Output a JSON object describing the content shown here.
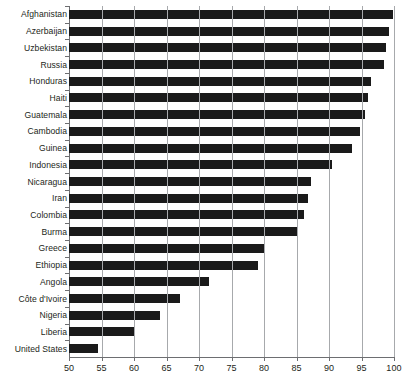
{
  "chart_data": {
    "type": "bar",
    "orientation": "horizontal",
    "title": "",
    "subtitle": "",
    "xlabel": "",
    "ylabel": "",
    "xlim": [
      50,
      100
    ],
    "ylim": null,
    "grid": true,
    "legend": null,
    "legend_position": "none",
    "bar_color": "#1a1a1a",
    "xticks": [
      50,
      55,
      60,
      65,
      70,
      75,
      80,
      85,
      90,
      95,
      100
    ],
    "xticklabels": [
      "50",
      "55",
      "60",
      "65",
      "70",
      "75",
      "80",
      "85",
      "90",
      "95",
      "100"
    ],
    "categories": [
      "Afghanistan",
      "Azerbaijan",
      "Uzbekistan",
      "Russia",
      "Honduras",
      "Haiti",
      "Guatemala",
      "Cambodia",
      "Guinea",
      "Indonesia",
      "Nicaragua",
      "Iran",
      "Colombia",
      "Burma",
      "Greece",
      "Ethiopia",
      "Angola",
      "Côte d'Ivoire",
      "Nigeria",
      "Liberia",
      "United States"
    ],
    "values": [
      99.9,
      99.2,
      98.8,
      98.4,
      96.4,
      96.0,
      95.6,
      94.8,
      93.6,
      90.5,
      87.2,
      86.8,
      86.2,
      85.2,
      80.0,
      79.0,
      71.5,
      67.0,
      64.0,
      60.0,
      54.5
    ]
  },
  "colors": {
    "bar": "#1a1a1a",
    "grid": "#a7a9ac",
    "axis": "#6d6e71",
    "text": "#231f20",
    "background": "#ffffff"
  }
}
